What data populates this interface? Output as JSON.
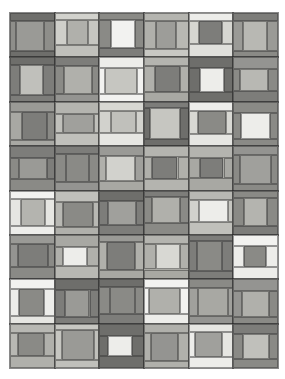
{
  "artwork": {
    "title": "Grayscale Patchwork Quilt",
    "type": "quilt-grid",
    "canvas": {
      "width": 285,
      "height": 379,
      "background": "#ffffff"
    },
    "quilt_area": {
      "x": 10,
      "y": 13,
      "width": 268,
      "height": 355
    },
    "grid": {
      "columns": 6,
      "rows": 8
    },
    "seam_color": "#3c3c3c",
    "palette": {
      "white": "#f2f2f0",
      "offwhite": "#e6e6e2",
      "light": "#d2d2cd",
      "light_mid": "#c0c0bb",
      "mid": "#a8a8a3",
      "mid_dark": "#949491",
      "dark": "#7d7d7a",
      "darker": "#6e6e6b",
      "darkest": "#5f5f5d"
    },
    "block_layout": {
      "description": "log-cabin / courthouse-steps: outer frame, horizontal bands top and bottom, vertical side strips, and a center square",
      "parts": [
        "frame",
        "top-band",
        "bottom-band",
        "left-strip",
        "right-strip",
        "center-square"
      ]
    },
    "blocks": [
      {
        "r": 0,
        "c": 0,
        "frame": "#7d7d7a",
        "top": "#6e6e6b",
        "bottom": "#6e6e6b",
        "left": "#8e8e8a",
        "right": "#8e8e8a",
        "center": "#9a9a96"
      },
      {
        "r": 0,
        "c": 1,
        "frame": "#c0c0bb",
        "top": "#d2d2cd",
        "bottom": "#c0c0bb",
        "left": "#cfcfca",
        "right": "#c6c6c1",
        "center": "#b0b0ab"
      },
      {
        "r": 0,
        "c": 2,
        "frame": "#7d7d7a",
        "top": "#8a8a86",
        "bottom": "#7d7d7a",
        "left": "#8a8a86",
        "right": "#8a8a86",
        "center": "#f2f2f0"
      },
      {
        "r": 0,
        "c": 3,
        "frame": "#a8a8a3",
        "top": "#b4b4af",
        "bottom": "#c8c8c3",
        "left": "#b0b0ab",
        "right": "#b8b8b3",
        "center": "#9d9d99"
      },
      {
        "r": 0,
        "c": 4,
        "frame": "#e6e6e2",
        "top": "#ededea",
        "bottom": "#e0e0dc",
        "left": "#d6d6d1",
        "right": "#d6d6d1",
        "center": "#7d7d7a"
      },
      {
        "r": 0,
        "c": 5,
        "frame": "#8a8a86",
        "top": "#7d7d7a",
        "bottom": "#8a8a86",
        "left": "#9a9a96",
        "right": "#9a9a96",
        "center": "#b8b8b3"
      },
      {
        "r": 1,
        "c": 0,
        "frame": "#7d7d7a",
        "top": "#6e6e6b",
        "bottom": "#7d7d7a",
        "left": "#7d7d7a",
        "right": "#7d7d7a",
        "center": "#c0c0bb"
      },
      {
        "r": 1,
        "c": 1,
        "frame": "#8a8a86",
        "top": "#7d7d7a",
        "bottom": "#949491",
        "left": "#8a8a86",
        "right": "#8a8a86",
        "center": "#b0b0ab"
      },
      {
        "r": 1,
        "c": 2,
        "frame": "#f2f2f0",
        "top": "#ededea",
        "bottom": "#f2f2f0",
        "left": "#f2f2f0",
        "right": "#f2f2f0",
        "center": "#c6c6c1"
      },
      {
        "r": 1,
        "c": 3,
        "frame": "#a8a8a3",
        "top": "#b4b4af",
        "bottom": "#a8a8a3",
        "left": "#b0b0ab",
        "right": "#b0b0ab",
        "center": "#7d7d7a"
      },
      {
        "r": 1,
        "c": 4,
        "frame": "#6e6e6b",
        "top": "#6e6e6b",
        "bottom": "#6e6e6b",
        "left": "#6e6e6b",
        "right": "#6e6e6b",
        "center": "#ededea"
      },
      {
        "r": 1,
        "c": 5,
        "frame": "#8a8a86",
        "top": "#949491",
        "bottom": "#7d7d7a",
        "left": "#8a8a86",
        "right": "#8a8a86",
        "center": "#b8b8b3"
      },
      {
        "r": 2,
        "c": 0,
        "frame": "#a8a8a3",
        "top": "#9a9a96",
        "bottom": "#a8a8a3",
        "left": "#a8a8a3",
        "right": "#8a8a86",
        "center": "#7d7d7a"
      },
      {
        "r": 2,
        "c": 1,
        "frame": "#c0c0bb",
        "top": "#b4b4af",
        "bottom": "#c0c0bb",
        "left": "#c0c0bb",
        "right": "#c0c0bb",
        "center": "#a0a09c"
      },
      {
        "r": 2,
        "c": 2,
        "frame": "#e0e0dc",
        "top": "#d8d8d3",
        "bottom": "#e6e6e2",
        "left": "#d2d2cd",
        "right": "#d2d2cd",
        "center": "#c0c0bb"
      },
      {
        "r": 2,
        "c": 3,
        "frame": "#6e6e6b",
        "top": "#7d7d7a",
        "bottom": "#6e6e6b",
        "left": "#6e6e6b",
        "right": "#6e6e6b",
        "center": "#c6c6c1"
      },
      {
        "r": 2,
        "c": 4,
        "frame": "#e6e6e2",
        "top": "#ededea",
        "bottom": "#e6e6e2",
        "left": "#d8d8d3",
        "right": "#d8d8d3",
        "center": "#8a8a86"
      },
      {
        "r": 2,
        "c": 5,
        "frame": "#7d7d7a",
        "top": "#8a8a86",
        "bottom": "#8a8a86",
        "left": "#8a8a86",
        "right": "#8a8a86",
        "center": "#ededea"
      },
      {
        "r": 3,
        "c": 0,
        "frame": "#8a8a86",
        "top": "#7d7d7a",
        "bottom": "#8a8a86",
        "left": "#8a8a86",
        "right": "#7d7d7a",
        "center": "#9a9a96"
      },
      {
        "r": 3,
        "c": 1,
        "frame": "#8a8a86",
        "top": "#7d7d7a",
        "bottom": "#949491",
        "left": "#8a8a86",
        "right": "#8a8a86",
        "center": "#8a8a86"
      },
      {
        "r": 3,
        "c": 2,
        "frame": "#a8a8a3",
        "top": "#9a9a96",
        "bottom": "#a8a8a3",
        "left": "#b0b0ab",
        "right": "#a0a09c",
        "center": "#d2d2cd"
      },
      {
        "r": 3,
        "c": 3,
        "frame": "#a8a8a3",
        "top": "#b4b4af",
        "bottom": "#b4b4af",
        "left": "#b0b0ab",
        "right": "#b0b0ab",
        "center": "#7d7d7a"
      },
      {
        "r": 3,
        "c": 4,
        "frame": "#a8a8a3",
        "top": "#b4b4af",
        "bottom": "#a8a8a3",
        "left": "#a8a8a3",
        "right": "#a8a8a3",
        "center": "#7d7d7a"
      },
      {
        "r": 3,
        "c": 5,
        "frame": "#8a8a86",
        "top": "#949491",
        "bottom": "#8a8a86",
        "left": "#8a8a86",
        "right": "#8a8a86",
        "center": "#a0a09c"
      },
      {
        "r": 4,
        "c": 0,
        "frame": "#ededea",
        "top": "#f2f2f0",
        "bottom": "#ededea",
        "left": "#e6e6e2",
        "right": "#e6e6e2",
        "center": "#b4b4af"
      },
      {
        "r": 4,
        "c": 1,
        "frame": "#b0b0ab",
        "top": "#c0c0bb",
        "bottom": "#b0b0ab",
        "left": "#b8b8b3",
        "right": "#b8b8b3",
        "center": "#8a8a86"
      },
      {
        "r": 4,
        "c": 2,
        "frame": "#7d7d7a",
        "top": "#6e6e6b",
        "bottom": "#7d7d7a",
        "left": "#7d7d7a",
        "right": "#7d7d7a",
        "center": "#a0a09c"
      },
      {
        "r": 4,
        "c": 3,
        "frame": "#8a8a86",
        "top": "#7d7d7a",
        "bottom": "#8a8a86",
        "left": "#8a8a86",
        "right": "#8a8a86",
        "center": "#b0b0ab"
      },
      {
        "r": 4,
        "c": 4,
        "frame": "#c0c0bb",
        "top": "#b8b8b3",
        "bottom": "#c0c0bb",
        "left": "#d2d2cd",
        "right": "#c6c6c1",
        "center": "#ededea"
      },
      {
        "r": 4,
        "c": 5,
        "frame": "#7d7d7a",
        "top": "#8a8a86",
        "bottom": "#7d7d7a",
        "left": "#8a8a86",
        "right": "#8a8a86",
        "center": "#b4b4af"
      },
      {
        "r": 5,
        "c": 0,
        "frame": "#8a8a86",
        "top": "#9a9a96",
        "bottom": "#8a8a86",
        "left": "#949491",
        "right": "#8a8a86",
        "center": "#7d7d7a"
      },
      {
        "r": 5,
        "c": 1,
        "frame": "#b0b0ab",
        "top": "#a8a8a3",
        "bottom": "#b8b8b3",
        "left": "#b0b0ab",
        "right": "#b0b0ab",
        "center": "#ededea"
      },
      {
        "r": 5,
        "c": 2,
        "frame": "#a8a8a3",
        "top": "#9a9a96",
        "bottom": "#a8a8a3",
        "left": "#b0b0ab",
        "right": "#b0b0ab",
        "center": "#7d7d7a"
      },
      {
        "r": 5,
        "c": 3,
        "frame": "#a8a8a3",
        "top": "#b4b4af",
        "bottom": "#a8a8a3",
        "left": "#b0b0ab",
        "right": "#b0b0ab",
        "center": "#d8d8d3"
      },
      {
        "r": 5,
        "c": 4,
        "frame": "#7d7d7a",
        "top": "#7d7d7a",
        "bottom": "#7d7d7a",
        "left": "#7d7d7a",
        "right": "#7d7d7a",
        "center": "#8a8a86"
      },
      {
        "r": 5,
        "c": 5,
        "frame": "#f2f2f0",
        "top": "#f2f2f0",
        "bottom": "#ededea",
        "left": "#ededea",
        "right": "#ededea",
        "center": "#8a8a86"
      },
      {
        "r": 6,
        "c": 0,
        "frame": "#ededea",
        "top": "#f2f2f0",
        "bottom": "#e6e6e2",
        "left": "#ededea",
        "right": "#ededea",
        "center": "#8a8a86"
      },
      {
        "r": 6,
        "c": 1,
        "frame": "#7d7d7a",
        "top": "#6e6e6b",
        "bottom": "#7d7d7a",
        "left": "#7d7d7a",
        "right": "#7d7d7a",
        "center": "#9a9a96"
      },
      {
        "r": 6,
        "c": 2,
        "frame": "#7d7d7a",
        "top": "#6e6e6b",
        "bottom": "#7d7d7a",
        "left": "#8a8a86",
        "right": "#8a8a86",
        "center": "#8a8a86"
      },
      {
        "r": 6,
        "c": 3,
        "frame": "#ededea",
        "top": "#f2f2f0",
        "bottom": "#ededea",
        "left": "#f2f2f0",
        "right": "#f2f2f0",
        "center": "#b0b0ab"
      },
      {
        "r": 6,
        "c": 4,
        "frame": "#949491",
        "top": "#8a8a86",
        "bottom": "#949491",
        "left": "#a0a09c",
        "right": "#a0a09c",
        "center": "#a8a8a3"
      },
      {
        "r": 6,
        "c": 5,
        "frame": "#8a8a86",
        "top": "#949491",
        "bottom": "#8a8a86",
        "left": "#949491",
        "right": "#8a8a86",
        "center": "#b0b0ab"
      },
      {
        "r": 7,
        "c": 0,
        "frame": "#b0b0ab",
        "top": "#b8b8b3",
        "bottom": "#b0b0ab",
        "left": "#b8b8b3",
        "right": "#b0b0ab",
        "center": "#8a8a86"
      },
      {
        "r": 7,
        "c": 1,
        "frame": "#c0c0bb",
        "top": "#c6c6c1",
        "bottom": "#c0c0bb",
        "left": "#c6c6c1",
        "right": "#c0c0bb",
        "center": "#9a9a96"
      },
      {
        "r": 7,
        "c": 2,
        "frame": "#6e6e6b",
        "top": "#6e6e6b",
        "bottom": "#6e6e6b",
        "left": "#6e6e6b",
        "right": "#6e6e6b",
        "center": "#ededea"
      },
      {
        "r": 7,
        "c": 3,
        "frame": "#a8a8a3",
        "top": "#b0b0ab",
        "bottom": "#b0b0ab",
        "left": "#b0b0ab",
        "right": "#b0b0ab",
        "center": "#949491"
      },
      {
        "r": 7,
        "c": 4,
        "frame": "#ededea",
        "top": "#e6e6e2",
        "bottom": "#ededea",
        "left": "#ededea",
        "right": "#e6e6e2",
        "center": "#a0a09c"
      },
      {
        "r": 7,
        "c": 5,
        "frame": "#7d7d7a",
        "top": "#7d7d7a",
        "bottom": "#8a8a86",
        "left": "#8a8a86",
        "right": "#8a8a86",
        "center": "#c0c0bb"
      }
    ]
  }
}
